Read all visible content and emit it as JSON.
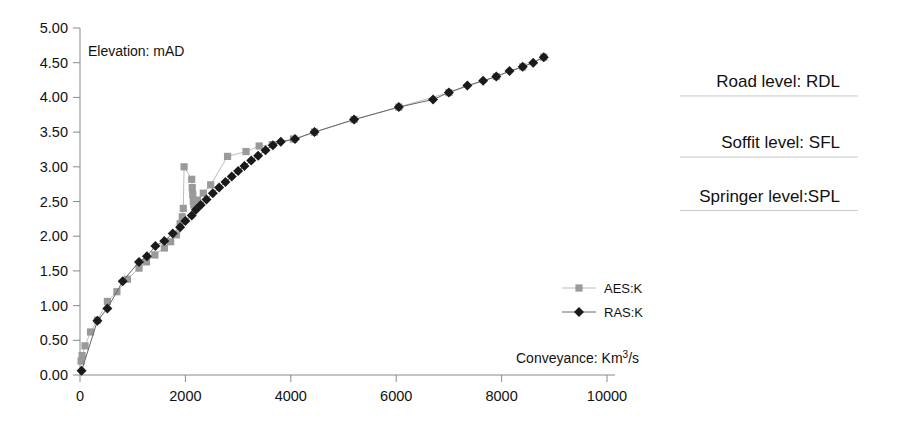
{
  "chart_data": {
    "type": "line",
    "title": "",
    "xlabel": "Conveyance: Km³/s",
    "ylabel": "Elevation: mAD",
    "xlim": [
      0,
      10000
    ],
    "ylim": [
      0.0,
      5.0
    ],
    "xticks": [
      0,
      2000,
      4000,
      6000,
      8000,
      10000
    ],
    "yticks": [
      0.0,
      0.5,
      1.0,
      1.5,
      2.0,
      2.5,
      3.0,
      3.5,
      4.0,
      4.5,
      5.0
    ],
    "xtick_labels": [
      "0",
      "2000",
      "4000",
      "6000",
      "8000",
      "10000"
    ],
    "ytick_labels": [
      "0.00",
      "0.50",
      "1.00",
      "1.50",
      "2.00",
      "2.50",
      "3.00",
      "3.50",
      "4.00",
      "4.50",
      "5.00"
    ],
    "grid": false,
    "legend_position": "center-right-inside",
    "series": [
      {
        "name": "AES:K",
        "marker": "square",
        "color": "#9a9a9a",
        "line_color": "#bdbdbd",
        "points": [
          [
            20,
            0.2
          ],
          [
            40,
            0.28
          ],
          [
            95,
            0.42
          ],
          [
            200,
            0.62
          ],
          [
            330,
            0.79
          ],
          [
            520,
            1.06
          ],
          [
            700,
            1.2
          ],
          [
            900,
            1.38
          ],
          [
            1120,
            1.54
          ],
          [
            1260,
            1.63
          ],
          [
            1420,
            1.73
          ],
          [
            1600,
            1.83
          ],
          [
            1720,
            1.92
          ],
          [
            1830,
            2.02
          ],
          [
            1900,
            2.18
          ],
          [
            1940,
            2.28
          ],
          [
            1960,
            2.4
          ],
          [
            1975,
            3.0
          ],
          [
            2120,
            2.82
          ],
          [
            2130,
            2.7
          ],
          [
            2140,
            2.6
          ],
          [
            2150,
            2.5
          ],
          [
            2160,
            2.45
          ],
          [
            2230,
            2.52
          ],
          [
            2340,
            2.62
          ],
          [
            2480,
            2.74
          ],
          [
            2800,
            3.15
          ],
          [
            3150,
            3.22
          ],
          [
            3400,
            3.3
          ],
          [
            3650,
            3.32
          ],
          [
            4050,
            3.4
          ],
          [
            4450,
            3.5
          ],
          [
            5200,
            3.68
          ],
          [
            6050,
            3.86
          ],
          [
            7000,
            4.07
          ],
          [
            7900,
            4.3
          ],
          [
            8400,
            4.44
          ],
          [
            8800,
            4.58
          ]
        ]
      },
      {
        "name": "RAS:K",
        "marker": "diamond",
        "color": "#1a1a1a",
        "line_color": "#666666",
        "points": [
          [
            30,
            0.06
          ],
          [
            330,
            0.78
          ],
          [
            520,
            0.96
          ],
          [
            810,
            1.35
          ],
          [
            1120,
            1.63
          ],
          [
            1270,
            1.71
          ],
          [
            1430,
            1.86
          ],
          [
            1600,
            1.93
          ],
          [
            1760,
            2.04
          ],
          [
            1900,
            2.13
          ],
          [
            2000,
            2.22
          ],
          [
            2120,
            2.3
          ],
          [
            2200,
            2.38
          ],
          [
            2290,
            2.45
          ],
          [
            2400,
            2.53
          ],
          [
            2520,
            2.62
          ],
          [
            2640,
            2.7
          ],
          [
            2760,
            2.78
          ],
          [
            2880,
            2.86
          ],
          [
            3000,
            2.94
          ],
          [
            3120,
            3.01
          ],
          [
            3250,
            3.09
          ],
          [
            3380,
            3.16
          ],
          [
            3520,
            3.24
          ],
          [
            3660,
            3.31
          ],
          [
            3810,
            3.36
          ],
          [
            4080,
            3.4
          ],
          [
            4450,
            3.5
          ],
          [
            5200,
            3.68
          ],
          [
            6050,
            3.86
          ],
          [
            6700,
            3.97
          ],
          [
            7000,
            4.07
          ],
          [
            7350,
            4.17
          ],
          [
            7650,
            4.24
          ],
          [
            7900,
            4.3
          ],
          [
            8150,
            4.38
          ],
          [
            8400,
            4.44
          ],
          [
            8600,
            4.5
          ],
          [
            8800,
            4.58
          ]
        ]
      }
    ],
    "annotations": [
      {
        "id": "road-level",
        "text": "Road level: RDL",
        "x": 10000,
        "y": 4.15
      },
      {
        "id": "soffit-level",
        "text": "Soffit level: SFL",
        "x": 10000,
        "y": 3.27
      },
      {
        "id": "springer-level",
        "text": "Springer level:SPL",
        "x": 10000,
        "y": 2.5
      }
    ]
  }
}
